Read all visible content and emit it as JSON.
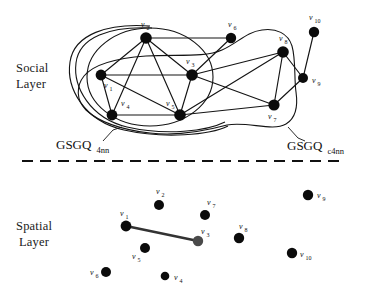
{
  "figure": {
    "background_color": "#ffffff",
    "ink_color": "#111111"
  },
  "labels": {
    "social_layer_line1": "Social",
    "social_layer_line2": "Layer",
    "spatial_layer_line1": "Spatial",
    "spatial_layer_line2": "Layer",
    "gsgq_left_base": "GSGQ",
    "gsgq_left_sub": "4nn",
    "gsgq_right_base": "GSGQ",
    "gsgq_right_sub": "c4nn"
  },
  "social_layer": {
    "name": "Social Layer",
    "nodes": [
      {
        "id": "v1",
        "label": "v",
        "sub": "1",
        "x": 101,
        "y": 75,
        "lx": 104,
        "ly": 88,
        "r": 5.4
      },
      {
        "id": "v2",
        "label": "v",
        "sub": "2",
        "x": 146,
        "y": 38,
        "lx": 141,
        "ly": 27,
        "r": 5.8
      },
      {
        "id": "v3",
        "label": "v",
        "sub": "3",
        "x": 192,
        "y": 75,
        "lx": 186,
        "ly": 64,
        "r": 5.8
      },
      {
        "id": "v4",
        "label": "v",
        "sub": "4",
        "x": 112,
        "y": 115,
        "lx": 121,
        "ly": 106,
        "r": 5.4
      },
      {
        "id": "v5",
        "label": "v",
        "sub": "5",
        "x": 180,
        "y": 115,
        "lx": 168,
        "ly": 106,
        "r": 5.8
      },
      {
        "id": "v6",
        "label": "v",
        "sub": "6",
        "x": 231,
        "y": 38,
        "lx": 229,
        "ly": 27,
        "r": 5.2
      },
      {
        "id": "v7",
        "label": "v",
        "sub": "7",
        "x": 274,
        "y": 105,
        "lx": 268,
        "ly": 118,
        "r": 5.6
      },
      {
        "id": "v8",
        "label": "v",
        "sub": "8",
        "x": 283,
        "y": 52,
        "lx": 281,
        "ly": 41,
        "r": 5.8
      },
      {
        "id": "v9",
        "label": "v",
        "sub": "9",
        "x": 303,
        "y": 78,
        "lx": 311,
        "ly": 83,
        "r": 5.0
      },
      {
        "id": "v10",
        "label": "v",
        "sub": "10",
        "x": 314,
        "y": 32,
        "lx": 311,
        "ly": 20,
        "r": 5.2
      }
    ],
    "edges": [
      [
        "v1",
        "v2"
      ],
      [
        "v1",
        "v3"
      ],
      [
        "v1",
        "v4"
      ],
      [
        "v1",
        "v5"
      ],
      [
        "v2",
        "v3"
      ],
      [
        "v2",
        "v4"
      ],
      [
        "v2",
        "v5"
      ],
      [
        "v2",
        "v6"
      ],
      [
        "v3",
        "v5"
      ],
      [
        "v3",
        "v7"
      ],
      [
        "v3",
        "v8"
      ],
      [
        "v4",
        "v5"
      ],
      [
        "v5",
        "v7"
      ],
      [
        "v5",
        "v8"
      ],
      [
        "v6",
        "v3"
      ],
      [
        "v7",
        "v8"
      ],
      [
        "v7",
        "v9"
      ],
      [
        "v8",
        "v9"
      ],
      [
        "v9",
        "v10"
      ]
    ]
  },
  "spatial_layer": {
    "name": "Spatial Layer",
    "nodes": [
      {
        "id": "v1",
        "label": "v",
        "sub": "1",
        "x": 126,
        "y": 226,
        "lx": 121,
        "ly": 215,
        "r": 5.4,
        "grey": false
      },
      {
        "id": "v2",
        "label": "v",
        "sub": "2",
        "x": 159,
        "y": 205,
        "lx": 157,
        "ly": 194,
        "r": 5.0,
        "grey": false
      },
      {
        "id": "v3",
        "label": "v",
        "sub": "3",
        "x": 198,
        "y": 241,
        "lx": 202,
        "ly": 233,
        "r": 5.2,
        "grey": true
      },
      {
        "id": "v4",
        "label": "v",
        "sub": "4",
        "x": 165,
        "y": 276,
        "lx": 174,
        "ly": 279,
        "r": 4.3,
        "grey": false
      },
      {
        "id": "v5",
        "label": "v",
        "sub": "5",
        "x": 145,
        "y": 248,
        "lx": 134,
        "ly": 258,
        "r": 5.0,
        "grey": false
      },
      {
        "id": "v6",
        "label": "v",
        "sub": "6",
        "x": 106,
        "y": 272,
        "lx": 92,
        "ly": 274,
        "r": 5.0,
        "grey": false
      },
      {
        "id": "v7",
        "label": "v",
        "sub": "7",
        "x": 205,
        "y": 215,
        "lx": 208,
        "ly": 205,
        "r": 5.0,
        "grey": false
      },
      {
        "id": "v8",
        "label": "v",
        "sub": "8",
        "x": 239,
        "y": 238,
        "lx": 240,
        "ly": 228,
        "r": 5.2,
        "grey": false
      },
      {
        "id": "v9",
        "label": "v",
        "sub": "9",
        "x": 308,
        "y": 195,
        "lx": 318,
        "ly": 197,
        "r": 5.2,
        "grey": false
      },
      {
        "id": "v10",
        "label": "v",
        "sub": "10",
        "x": 292,
        "y": 253,
        "lx": 301,
        "ly": 256,
        "r": 5.2,
        "grey": false
      }
    ],
    "edges": [
      [
        "v1",
        "v3"
      ]
    ]
  },
  "divider": {
    "name": "dashed-divider",
    "y": 161,
    "x_start": 22,
    "x_end": 341
  }
}
